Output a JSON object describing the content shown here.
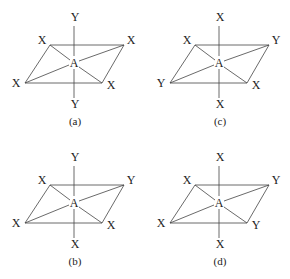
{
  "figure": {
    "center_label": "A",
    "structures": [
      {
        "id": "a",
        "caption": "(a)",
        "top": "Y",
        "bottom": "Y",
        "back_left": "X",
        "back_right": "X",
        "front_left": "X",
        "front_right": "X"
      },
      {
        "id": "c",
        "caption": "(c)",
        "top": "X",
        "bottom": "X",
        "back_left": "X",
        "back_right": "Y",
        "front_left": "Y",
        "front_right": "X"
      },
      {
        "id": "b",
        "caption": "(b)",
        "top": "Y",
        "bottom": "X",
        "back_left": "X",
        "back_right": "Y",
        "front_left": "X",
        "front_right": "X"
      },
      {
        "id": "d",
        "caption": "(d)",
        "top": "X",
        "bottom": "X",
        "back_left": "X",
        "back_right": "Y",
        "front_left": "X",
        "front_right": "Y"
      }
    ]
  }
}
